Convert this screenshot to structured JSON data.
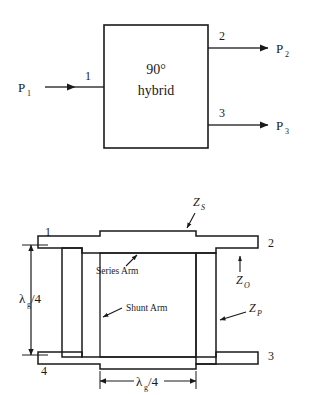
{
  "figure": {
    "top_diagram": {
      "name": "block-diagram",
      "block_label_line1": "90°",
      "block_label_line2": "hybrid",
      "input_label": "P",
      "input_sub": "1",
      "port_in": "1",
      "port_out_top": "2",
      "port_out_bottom": "3",
      "output_top_label": "P",
      "output_top_sub": "2",
      "output_bottom_label": "P",
      "output_bottom_sub": "3"
    },
    "bottom_diagram": {
      "name": "branch-line-coupler-layout",
      "ports": {
        "top_left": "1",
        "top_right": "2",
        "bottom_right": "3",
        "bottom_left": "4"
      },
      "impedance_series": "Z",
      "impedance_series_sub": "S",
      "impedance_char": "Z",
      "impedance_char_sub": "O",
      "impedance_shunt": "Z",
      "impedance_shunt_sub": "P",
      "annotation_series_arm": "Series Arm",
      "annotation_shunt_arm": "Shunt Arm",
      "dimension_vertical_lambda": "λ",
      "dimension_vertical_sub": "g",
      "dimension_vertical_rest": "/4",
      "dimension_horizontal_lambda": "λ",
      "dimension_horizontal_sub": "g",
      "dimension_horizontal_rest": "/4"
    }
  },
  "colors": {
    "ink": "#1a1a1a",
    "background": "#ffffff"
  }
}
